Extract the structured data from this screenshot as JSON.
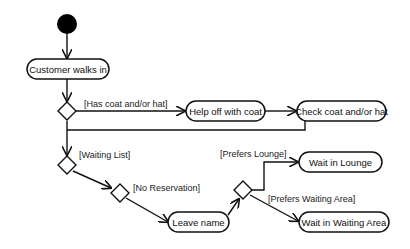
{
  "diagram": {
    "type": "UML activity diagram",
    "colors": {
      "stroke": "#111111",
      "background": "#ffffff",
      "start_fill": "#000000"
    },
    "start_node": {
      "id": "start"
    },
    "actions": [
      {
        "id": "a1",
        "label": "Customer walks in"
      },
      {
        "id": "a2",
        "label": "Help off with coat"
      },
      {
        "id": "a3",
        "label": "Check coat and/or hat"
      },
      {
        "id": "a4",
        "label": "Leave name"
      },
      {
        "id": "a5",
        "label": "Wait in Lounge"
      },
      {
        "id": "a6",
        "label": "Wait in Waiting Area"
      }
    ],
    "decisions": [
      {
        "id": "d1"
      },
      {
        "id": "d2"
      },
      {
        "id": "d3"
      },
      {
        "id": "d4"
      }
    ],
    "guards": {
      "has_coat": "[Has coat and/or hat]",
      "waiting_list": "[Waiting List]",
      "no_reservation": "[No Reservation]",
      "prefers_lounge": "[Prefers Lounge]",
      "prefers_waiting_area": "[Prefers Waiting Area]"
    },
    "edges": [
      {
        "from": "start",
        "to": "a1"
      },
      {
        "from": "a1",
        "to": "d1"
      },
      {
        "from": "d1",
        "to": "a2",
        "guard": "[Has coat and/or hat]"
      },
      {
        "from": "a2",
        "to": "a3"
      },
      {
        "from": "a3",
        "to": "d2"
      },
      {
        "from": "d1",
        "to": "d2"
      },
      {
        "from": "d2",
        "to": "d3",
        "guard": "[Waiting List]"
      },
      {
        "from": "d3",
        "to": "a4",
        "guard": "[No Reservation]"
      },
      {
        "from": "a4",
        "to": "d4"
      },
      {
        "from": "d4",
        "to": "a5",
        "guard": "[Prefers Lounge]"
      },
      {
        "from": "d4",
        "to": "a6",
        "guard": "[Prefers Waiting Area]"
      }
    ]
  }
}
